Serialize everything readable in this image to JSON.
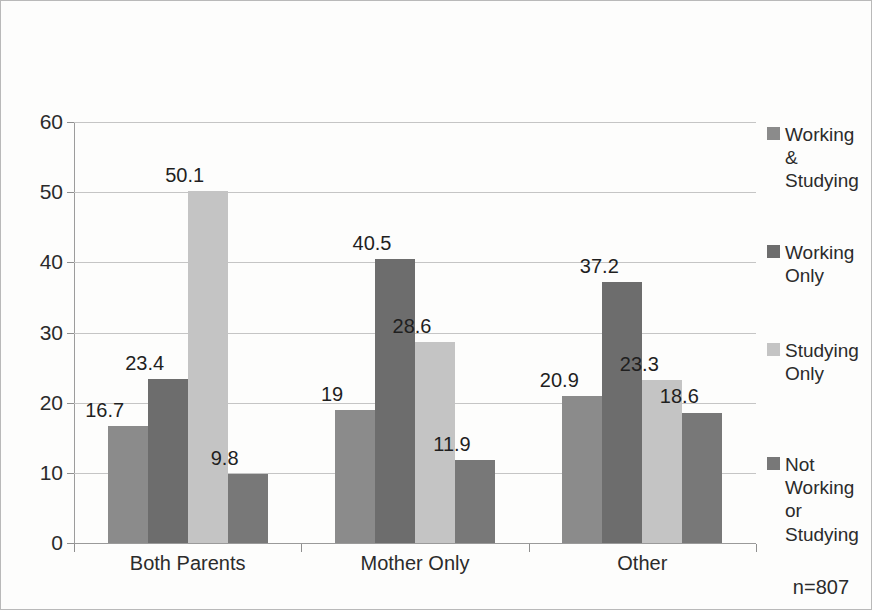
{
  "chart_data": {
    "type": "bar",
    "title": "",
    "subtitle": "",
    "xlabel": "",
    "ylabel": "",
    "ylim": [
      0,
      60
    ],
    "y_ticks": [
      0,
      10,
      20,
      30,
      40,
      50,
      60
    ],
    "grid": true,
    "legend_position": "right",
    "categories": [
      "Both Parents",
      "Mother Only",
      "Other"
    ],
    "series": [
      {
        "name": "Working & Studying",
        "legend_label": "Working\n&\nStudying",
        "color": "#8b8b8b",
        "values": [
          16.7,
          19,
          20.9
        ],
        "value_labels": [
          "16.7",
          "19",
          "20.9"
        ]
      },
      {
        "name": "Working Only",
        "legend_label": "Working\nOnly",
        "color": "#6d6d6d",
        "values": [
          23.4,
          40.5,
          37.2
        ],
        "value_labels": [
          "23.4",
          "40.5",
          "37.2"
        ]
      },
      {
        "name": "Studying Only",
        "legend_label": "Studying\nOnly",
        "color": "#c4c4c4",
        "values": [
          50.1,
          28.6,
          23.3
        ],
        "value_labels": [
          "50.1",
          "28.6",
          "23.3"
        ]
      },
      {
        "name": "Not Working or Studying",
        "legend_label": "Not\nWorking\nor\nStudying",
        "color": "#787878",
        "values": [
          9.8,
          11.9,
          18.6
        ],
        "value_labels": [
          "9.8",
          "11.9",
          "18.6"
        ]
      }
    ],
    "annotations": [
      {
        "name": "sample-size",
        "text": "n=807"
      }
    ]
  }
}
